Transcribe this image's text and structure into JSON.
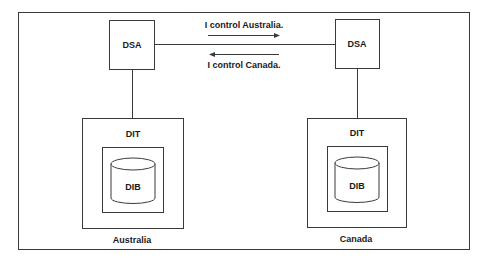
{
  "diagram": {
    "nodes": {
      "left_dsa": {
        "label": "DSA"
      },
      "right_dsa": {
        "label": "DSA"
      },
      "left_dit": {
        "label": "DIT"
      },
      "right_dit": {
        "label": "DIT"
      },
      "left_dib": {
        "label": "DIB"
      },
      "right_dib": {
        "label": "DIB"
      }
    },
    "messages": {
      "to_right": "I control Australia.",
      "to_left": "I control Canada."
    },
    "regions": {
      "left": "Australia",
      "right": "Canada"
    },
    "colors": {
      "stroke": "#3a3a3a",
      "text": "#1a1a1a",
      "background": "#ffffff"
    }
  }
}
